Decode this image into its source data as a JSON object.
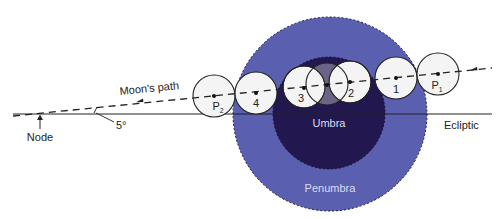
{
  "colors": {
    "background": "#ffffff",
    "penumbra": "#5a5fb0",
    "umbra": "#22184f",
    "moon_fill": "#f4f4f4",
    "line": "#222222",
    "shadow_label": "#dcdcf0"
  },
  "labels": {
    "node": "Node",
    "angle": "5°",
    "moons_path": "Moon's path",
    "ecliptic": "Ecliptic",
    "umbra": "Umbra",
    "penumbra": "Penumbra"
  },
  "shadow": {
    "penumbra": {
      "cx": 330,
      "cy": 114,
      "r": 97
    },
    "umbra": {
      "cx": 329,
      "cy": 113,
      "r": 56
    }
  },
  "moon_positions": [
    {
      "id": "P2",
      "label": "P",
      "sub": "2",
      "cx": 214,
      "cy": 96,
      "r": 21
    },
    {
      "id": "4",
      "label": "4",
      "sub": "",
      "cx": 256,
      "cy": 93,
      "r": 21
    },
    {
      "id": "3",
      "label": "3",
      "sub": "",
      "cx": 304,
      "cy": 87,
      "r": 21
    },
    {
      "id": "mid",
      "label": "",
      "sub": "",
      "cx": 327,
      "cy": 84,
      "r": 21
    },
    {
      "id": "2",
      "label": "2",
      "sub": "",
      "cx": 350,
      "cy": 82,
      "r": 21
    },
    {
      "id": "1",
      "label": "1",
      "sub": "",
      "cx": 396,
      "cy": 78,
      "r": 21
    },
    {
      "id": "P1",
      "label": "P",
      "sub": "1",
      "cx": 438,
      "cy": 74,
      "r": 21
    }
  ]
}
